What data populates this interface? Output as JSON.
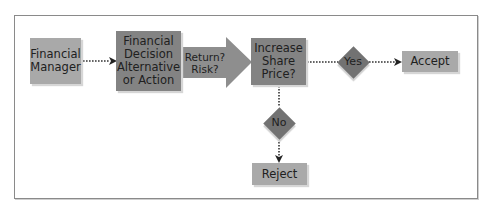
{
  "diagram": {
    "type": "flowchart",
    "nodes": {
      "financial_manager": "Financial\nManager",
      "decision": "Financial\nDecision\nAlternative\nor Action",
      "evaluation_arrow": "Return?\nRisk?",
      "increase_share_price": "Increase\nShare\nPrice?",
      "yes": "Yes",
      "no": "No",
      "accept": "Accept",
      "reject": "Reject"
    },
    "edges": [
      {
        "from": "financial_manager",
        "to": "decision",
        "style": "dotted-arrow"
      },
      {
        "from": "decision",
        "to": "increase_share_price",
        "style": "block-arrow",
        "label": "Return? Risk?"
      },
      {
        "from": "increase_share_price",
        "to": "yes",
        "style": "dotted"
      },
      {
        "from": "yes",
        "to": "accept",
        "style": "dotted-arrow"
      },
      {
        "from": "increase_share_price",
        "to": "no",
        "style": "dotted"
      },
      {
        "from": "no",
        "to": "reject",
        "style": "dotted-arrow"
      }
    ],
    "colors": {
      "light_box": "#a9a9a9",
      "dark_box": "#838383",
      "diamond": "#727272",
      "frame": "#8a8a8a"
    }
  }
}
